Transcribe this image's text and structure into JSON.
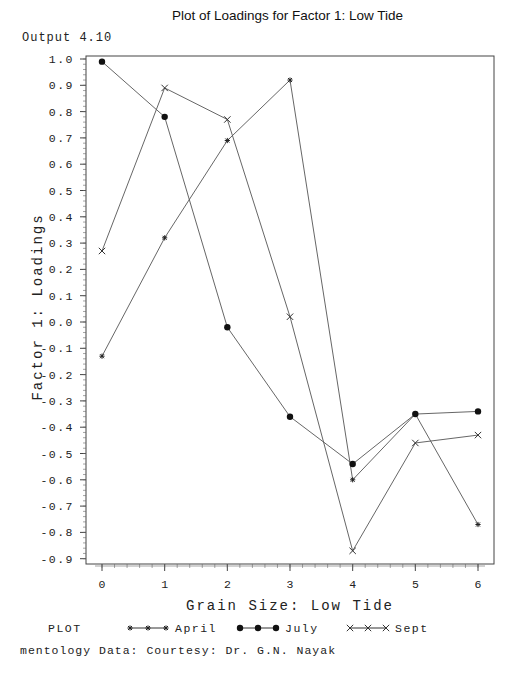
{
  "output_label": "Output 4.10",
  "footer": "mentology Data: Courtesy: Dr. G.N. Nayak",
  "chart_data": {
    "type": "line",
    "title": "Plot of Loadings for Factor 1: Low Tide",
    "xlabel": "Grain Size: Low Tide",
    "ylabel": "Factor 1: Loadings",
    "x": [
      0,
      1,
      2,
      3,
      4,
      5,
      6
    ],
    "x_ticks": [
      "0",
      "1",
      "2",
      "3",
      "4",
      "5",
      "6"
    ],
    "y_ticks": [
      "1.0",
      "0.9",
      "0.8",
      "0.7",
      "0.6",
      "0.5",
      "0.4",
      "0.3",
      "0.2",
      "0.1",
      "0.0",
      "-0.1",
      "-0.2",
      "-0.3",
      "-0.4",
      "-0.5",
      "-0.6",
      "-0.7",
      "-0.8",
      "-0.9"
    ],
    "ylim": [
      -0.9,
      1.0
    ],
    "grid": false,
    "legend_position": "bottom",
    "legend_prefix": "PLOT",
    "series": [
      {
        "name": "April",
        "marker": "star",
        "values": [
          -0.13,
          0.32,
          0.69,
          0.92,
          -0.6,
          -0.35,
          -0.77
        ]
      },
      {
        "name": "July",
        "marker": "dot",
        "values": [
          0.99,
          0.78,
          -0.02,
          -0.36,
          -0.54,
          -0.35,
          -0.34
        ]
      },
      {
        "name": "Sept",
        "marker": "x",
        "values": [
          0.27,
          0.89,
          0.77,
          0.02,
          -0.87,
          -0.46,
          -0.43
        ]
      }
    ]
  }
}
